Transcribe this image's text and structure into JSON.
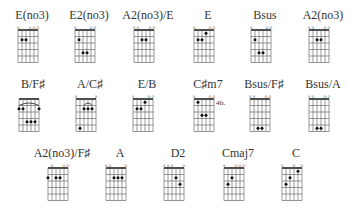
{
  "strings": 6,
  "frets_shown": 5,
  "rows": [
    [
      {
        "name": "E(no3)",
        "markers": [
          "o",
          "",
          "",
          "x",
          "o",
          "o"
        ],
        "dots": [
          [
            2,
            2
          ],
          [
            3,
            2
          ]
        ],
        "barre": null,
        "position": ""
      },
      {
        "name": "E2(no3)",
        "markers": [
          "o",
          "",
          "",
          "",
          "o",
          "o"
        ],
        "dots": [
          [
            2,
            2
          ],
          [
            3,
            4
          ],
          [
            4,
            4
          ]
        ],
        "barre": null,
        "position": ""
      },
      {
        "name": "A2(no3)/E",
        "markers": [
          "o",
          "o",
          "",
          "",
          "o",
          "o"
        ],
        "dots": [
          [
            3,
            2
          ],
          [
            4,
            2
          ]
        ],
        "barre": null,
        "position": ""
      },
      {
        "name": "E",
        "markers": [
          "o",
          "",
          "",
          "",
          "o",
          "o"
        ],
        "dots": [
          [
            2,
            2
          ],
          [
            3,
            2
          ],
          [
            4,
            1
          ]
        ],
        "barre": null,
        "position": ""
      },
      {
        "name": "Bsus",
        "markers": [
          "x",
          "",
          "",
          "",
          "o",
          "o"
        ],
        "dots": [
          [
            2,
            2
          ],
          [
            3,
            4
          ],
          [
            4,
            4
          ]
        ],
        "barre": null,
        "position": ""
      },
      {
        "name": "A2(no3)",
        "markers": [
          "x",
          "o",
          "",
          "",
          "o",
          "o"
        ],
        "dots": [
          [
            3,
            2
          ],
          [
            4,
            2
          ]
        ],
        "barre": null,
        "position": ""
      }
    ],
    [
      {
        "name": "B/F♯",
        "markers": [
          "",
          "",
          "",
          "",
          "",
          ""
        ],
        "dots": [
          [
            1,
            2
          ],
          [
            2,
            2
          ],
          [
            6,
            2
          ],
          [
            3,
            4
          ],
          [
            4,
            4
          ],
          [
            5,
            4
          ]
        ],
        "barre": {
          "fret": 1,
          "from": 1,
          "to": 6
        },
        "position": ""
      },
      {
        "name": "A/C♯",
        "markers": [
          "x",
          "",
          "",
          "",
          "",
          "x"
        ],
        "dots": [
          [
            3,
            2
          ],
          [
            4,
            2
          ],
          [
            5,
            2
          ],
          [
            2,
            5
          ]
        ],
        "barre": {
          "fret": 1,
          "from": 3,
          "to": 5
        },
        "position": ""
      },
      {
        "name": "E/B",
        "markers": [
          "x",
          "",
          "",
          "",
          "o",
          "o"
        ],
        "dots": [
          [
            2,
            2
          ],
          [
            3,
            2
          ],
          [
            4,
            1
          ]
        ],
        "barre": null,
        "position": ""
      },
      {
        "name": "C♯m7",
        "markers": [
          "x",
          "",
          "",
          "",
          "o",
          "o"
        ],
        "dots": [
          [
            2,
            1
          ],
          [
            3,
            3
          ],
          [
            4,
            3
          ]
        ],
        "barre": null,
        "position": "4fr."
      },
      {
        "name": "Bsus/F♯",
        "markers": [
          "x",
          "x",
          "",
          "",
          "o",
          "o"
        ],
        "dots": [
          [
            3,
            5
          ],
          [
            4,
            5
          ]
        ],
        "barre": null,
        "position": ""
      },
      {
        "name": "Bsus/A",
        "markers": [
          "x",
          "o",
          "",
          "",
          "o",
          "o"
        ],
        "dots": [
          [
            3,
            5
          ],
          [
            4,
            5
          ]
        ],
        "barre": null,
        "position": ""
      }
    ],
    [
      {
        "name": "A2(no3)/F♯",
        "markers": [
          "",
          "x",
          "",
          "",
          "o",
          "o"
        ],
        "dots": [
          [
            1,
            2
          ],
          [
            3,
            2
          ],
          [
            4,
            2
          ]
        ],
        "barre": null,
        "position": ""
      },
      {
        "name": "A",
        "markers": [
          "x",
          "o",
          "",
          "",
          "",
          "o"
        ],
        "dots": [
          [
            3,
            2
          ],
          [
            4,
            2
          ],
          [
            5,
            2
          ]
        ],
        "barre": null,
        "position": ""
      },
      {
        "name": "D2",
        "markers": [
          "x",
          "x",
          "o",
          "",
          "",
          "o"
        ],
        "dots": [
          [
            4,
            2
          ],
          [
            5,
            3
          ]
        ],
        "barre": null,
        "position": ""
      },
      {
        "name": "Cmaj7",
        "markers": [
          "x",
          "",
          "",
          "o",
          "o",
          "o"
        ],
        "dots": [
          [
            2,
            3
          ],
          [
            3,
            2
          ]
        ],
        "barre": null,
        "position": ""
      },
      {
        "name": "C",
        "markers": [
          "x",
          "",
          "",
          "o",
          "",
          "o"
        ],
        "dots": [
          [
            2,
            3
          ],
          [
            3,
            2
          ],
          [
            5,
            1
          ]
        ],
        "barre": null,
        "position": ""
      }
    ]
  ]
}
